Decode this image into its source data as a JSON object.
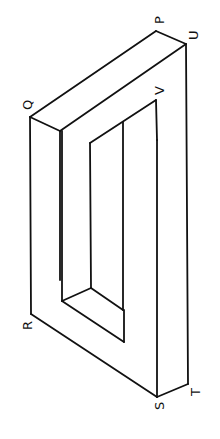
{
  "diagram": {
    "type": "isometric-frame",
    "stroke_color": "#111111",
    "background": "#ffffff",
    "labels": {
      "P": "P",
      "Q": "Q",
      "R": "R",
      "S": "S",
      "T": "T",
      "U": "U",
      "V": "V"
    }
  }
}
